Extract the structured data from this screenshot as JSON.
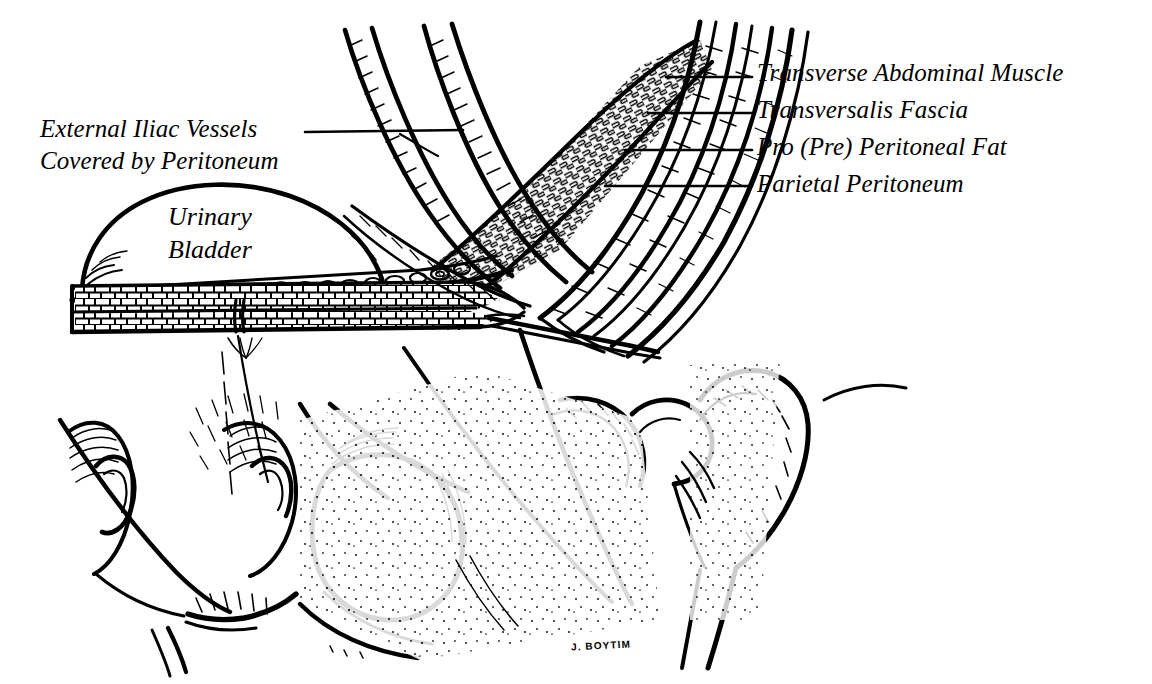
{
  "figure": {
    "ink_color": "#000000",
    "background_color": "#ffffff",
    "style": "pen-and-ink line drawing"
  },
  "labels_left": [
    {
      "id": "external-iliac-vessels",
      "line1": "External Iliac Vessels",
      "line2": "Covered by Peritoneum",
      "x": 40,
      "y": 113
    }
  ],
  "labels_right": [
    {
      "id": "transverse-abdominal-muscle",
      "text": "Transverse Abdominal Muscle",
      "x": 757,
      "y": 57
    },
    {
      "id": "transversalis-fascia",
      "text": "Transversalis Fascia",
      "x": 757,
      "y": 94
    },
    {
      "id": "pro-pre-peritoneal-fat",
      "text": "Pro (Pre) Peritoneal Fat",
      "x": 757,
      "y": 131
    },
    {
      "id": "parietal-peritoneum",
      "text": "Parietal Peritoneum",
      "x": 757,
      "y": 168
    }
  ],
  "organ_labels": [
    {
      "id": "urinary-bladder",
      "line1": "Urinary",
      "line2": "Bladder",
      "x": 168,
      "y": 200
    }
  ],
  "signature": {
    "text": "J. BOYTIM",
    "x": 571,
    "y": 640
  },
  "leader_lines": [
    {
      "id": "leader-external-iliac-vessels",
      "x1": 305,
      "y1": 132,
      "x2": 463,
      "y2": 130
    },
    {
      "id": "leader-transverse-abdominal-muscle",
      "x1": 666,
      "y1": 77,
      "x2": 752,
      "y2": 77
    },
    {
      "id": "leader-transversalis-fascia",
      "x1": 648,
      "y1": 113,
      "x2": 752,
      "y2": 113
    },
    {
      "id": "leader-pro-pre-peritoneal-fat",
      "x1": 625,
      "y1": 150,
      "x2": 752,
      "y2": 150
    },
    {
      "id": "leader-parietal-peritoneum",
      "x1": 605,
      "y1": 186,
      "x2": 752,
      "y2": 186
    }
  ],
  "structures": [
    {
      "id": "urinary-bladder",
      "name": "Urinary bladder dome"
    },
    {
      "id": "bladder-wall",
      "name": "Bladder wall in cross-section"
    },
    {
      "id": "external-iliac-vessels",
      "name": "External iliac vessels"
    },
    {
      "id": "preperitoneal-fat",
      "name": "Pro (pre) peritoneal fat"
    },
    {
      "id": "abdominal-wall-layers",
      "name": "Layered abdominal wall"
    },
    {
      "id": "pubic-symphysis",
      "name": "Pubic symphysis"
    },
    {
      "id": "obturator-foramen",
      "name": "Obturator foramen"
    },
    {
      "id": "acetabulum",
      "name": "Acetabulum"
    },
    {
      "id": "femoral-head",
      "name": "Femoral head and neck"
    },
    {
      "id": "greater-trochanter",
      "name": "Greater trochanter"
    },
    {
      "id": "surgical-instrument",
      "name": "Surgical instrument / retractor"
    }
  ]
}
